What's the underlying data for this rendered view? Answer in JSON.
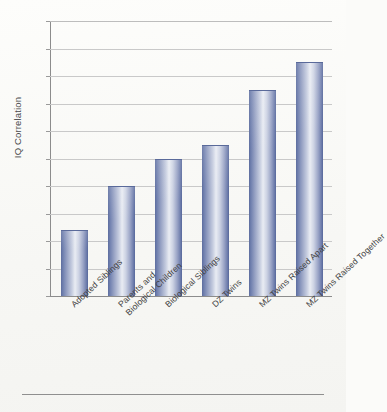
{
  "chart_data": {
    "type": "bar",
    "title": "",
    "xlabel": "",
    "ylabel": "IQ Correlation",
    "ylim": [
      0.0,
      1.0
    ],
    "grid": true,
    "legend": "none",
    "orientation": "vertical",
    "categories": [
      "Adopted Siblings",
      "Parents and Biological Children",
      "Biological Siblings",
      "DZ Twins",
      "MZ Twins Raised Apart",
      "MZ Twins Raised Together"
    ],
    "values": [
      0.24,
      0.4,
      0.5,
      0.55,
      0.75,
      0.85
    ],
    "ytick_labels": [
      "1.0",
      "0.9",
      "0.8",
      "0.7",
      "0.6",
      "0.5",
      "0.4",
      "0.3",
      "0.2",
      "0.1",
      "0.0"
    ],
    "ytick_values": [
      1.0,
      0.9,
      0.8,
      0.7,
      0.6,
      0.5,
      0.4,
      0.3,
      0.2,
      0.1,
      0.0
    ],
    "bar_color": "#7b88b4",
    "bar_edge_color": "#5a6a9a",
    "grid_color": "#c9c9c9",
    "axis_color": "#8c8c8c",
    "background_color": "#fbfbf9"
  },
  "axis": {
    "y_title": "IQ Correlation"
  },
  "xlabels": [
    {
      "line1": "Adopted Siblings",
      "line2": ""
    },
    {
      "line1": "Parents and",
      "line2": "Biological Children"
    },
    {
      "line1": "Biological Siblings",
      "line2": ""
    },
    {
      "line1": "DZ Twins",
      "line2": ""
    },
    {
      "line1": "MZ Twins Raised Apart",
      "line2": ""
    },
    {
      "line1": "MZ Twins Raised Together",
      "line2": ""
    }
  ]
}
